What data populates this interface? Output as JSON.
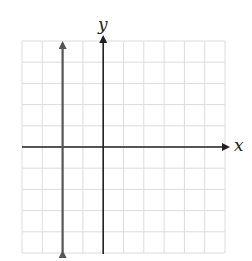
{
  "chart_data": {
    "type": "line",
    "title": "",
    "xlabel": "x",
    "ylabel": "y",
    "xlim": [
      -4,
      6
    ],
    "ylim": [
      -5,
      5
    ],
    "grid": true,
    "tick_labels_shown": false,
    "series": [
      {
        "name": "vertical line x = -2",
        "equation": "x = -2",
        "color": "#555555",
        "points": [
          [
            -2,
            -5
          ],
          [
            -2,
            5
          ]
        ],
        "arrows": "both"
      }
    ]
  },
  "colors": {
    "grid": "#dcdcdc",
    "axes": "#222222",
    "line": "#555555"
  },
  "labels": {
    "x_axis": "x",
    "y_axis": "y"
  }
}
